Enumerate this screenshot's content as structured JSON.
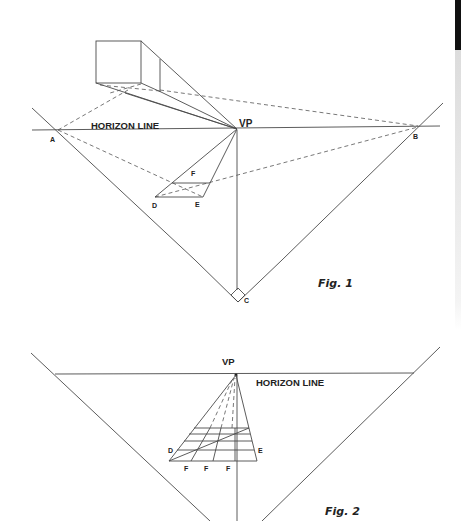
{
  "figure1": {
    "caption": "Fig. 1",
    "horizon_label": "HORIZON LINE",
    "vp_label": "VP",
    "points": {
      "A": "A",
      "B": "B",
      "C": "C",
      "D": "D",
      "E": "E",
      "F": "F"
    }
  },
  "figure2": {
    "caption": "Fig. 2",
    "horizon_label": "HORIZON LINE",
    "vp_label": "VP",
    "points": {
      "D": "D",
      "E": "E",
      "F1": "F",
      "F2": "F",
      "F3": "F"
    }
  },
  "colors": {
    "line": "#4a4a4a",
    "text": "#222222",
    "background": "#ffffff"
  }
}
